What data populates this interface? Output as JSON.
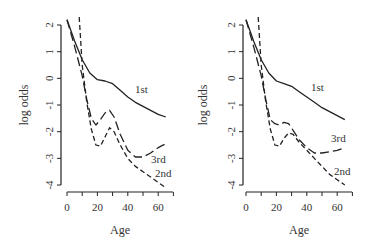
{
  "chart_data": [
    {
      "type": "line",
      "panel": "left",
      "xlabel": "Age",
      "ylabel": "log odds",
      "xlim": [
        0,
        70
      ],
      "ylim": [
        -4,
        2
      ],
      "xticks": [
        0,
        20,
        40,
        60
      ],
      "xticks_minor": [
        0,
        10,
        20,
        30,
        40,
        50,
        60,
        70
      ],
      "yticks": [
        2,
        1,
        0,
        -1,
        -2,
        -3,
        -4
      ],
      "series": [
        {
          "name": "1st",
          "style": "solid",
          "x": [
            0,
            5,
            10,
            15,
            20,
            25,
            30,
            35,
            40,
            45,
            50,
            55,
            60,
            65
          ],
          "y": [
            2.2,
            1.4,
            0.7,
            0.2,
            -0.05,
            -0.1,
            -0.2,
            -0.45,
            -0.7,
            -0.9,
            -1.05,
            -1.2,
            -1.35,
            -1.45
          ]
        },
        {
          "name": "2nd",
          "style": "short-dash",
          "x": [
            8,
            10,
            13,
            16,
            19,
            22,
            25,
            28,
            31,
            35,
            40,
            45,
            50,
            55,
            60,
            65
          ],
          "y": [
            2.3,
            0.5,
            -0.9,
            -1.9,
            -2.5,
            -2.55,
            -2.2,
            -1.85,
            -2.0,
            -2.5,
            -3.0,
            -3.3,
            -3.5,
            -3.7,
            -3.9,
            -4.1
          ]
        },
        {
          "name": "3rd",
          "style": "long-dash",
          "x": [
            0,
            5,
            10,
            13,
            16,
            19,
            22,
            25,
            28,
            31,
            35,
            40,
            45,
            50,
            55,
            60,
            65
          ],
          "y": [
            2.2,
            1.2,
            0.1,
            -0.8,
            -1.5,
            -1.75,
            -1.55,
            -1.3,
            -1.2,
            -1.45,
            -2.1,
            -2.7,
            -2.95,
            -2.95,
            -2.8,
            -2.6,
            -2.45
          ]
        }
      ],
      "annotations": [
        {
          "text": "1st",
          "x": 48,
          "y": -0.35
        },
        {
          "text": "3rd",
          "x": 60,
          "y": -3.05
        },
        {
          "text": "2nd",
          "x": 62,
          "y": -3.5
        }
      ]
    },
    {
      "type": "line",
      "panel": "right",
      "xlabel": "Age",
      "ylabel": "log odds",
      "xlim": [
        0,
        70
      ],
      "ylim": [
        -4,
        2
      ],
      "xticks": [
        0,
        20,
        40,
        60
      ],
      "xticks_minor": [
        0,
        10,
        20,
        30,
        40,
        50,
        60,
        70
      ],
      "yticks": [
        2,
        1,
        0,
        -1,
        -2,
        -3,
        -4
      ],
      "series": [
        {
          "name": "1st",
          "style": "solid",
          "x": [
            0,
            5,
            10,
            15,
            20,
            25,
            30,
            35,
            40,
            45,
            50,
            55,
            60,
            65
          ],
          "y": [
            2.2,
            1.4,
            0.7,
            0.2,
            -0.1,
            -0.2,
            -0.3,
            -0.5,
            -0.7,
            -0.9,
            -1.1,
            -1.25,
            -1.4,
            -1.55
          ]
        },
        {
          "name": "2nd",
          "style": "short-dash",
          "x": [
            8,
            10,
            13,
            16,
            19,
            22,
            25,
            28,
            31,
            35,
            40,
            45,
            50,
            55,
            60,
            65
          ],
          "y": [
            2.3,
            0.5,
            -0.9,
            -1.9,
            -2.5,
            -2.55,
            -2.25,
            -2.05,
            -2.1,
            -2.4,
            -2.7,
            -3.0,
            -3.3,
            -3.6,
            -3.8,
            -4.0
          ]
        },
        {
          "name": "3rd",
          "style": "long-dash",
          "x": [
            0,
            5,
            10,
            13,
            16,
            19,
            22,
            25,
            28,
            31,
            35,
            40,
            45,
            50,
            55,
            60,
            65
          ],
          "y": [
            2.2,
            1.2,
            0.1,
            -0.8,
            -1.55,
            -1.7,
            -1.75,
            -1.65,
            -1.7,
            -1.95,
            -2.3,
            -2.6,
            -2.8,
            -2.8,
            -2.75,
            -2.7,
            -2.6
          ]
        }
      ],
      "annotations": [
        {
          "text": "1st",
          "x": 46,
          "y": -0.3
        },
        {
          "text": "3rd",
          "x": 58,
          "y": -2.2
        },
        {
          "text": "2nd",
          "x": 60,
          "y": -3.6
        }
      ]
    }
  ],
  "panels": [
    {
      "ylabel": "log odds",
      "xlabel": "Age",
      "xtick_labels": [
        "0",
        "20",
        "40",
        "60"
      ],
      "ytick_labels": [
        "2",
        "1",
        "0",
        "-1",
        "-2",
        "-3",
        "-4"
      ],
      "labels": {
        "first": "1st",
        "second": "2nd",
        "third": "3rd"
      }
    },
    {
      "ylabel": "log odds",
      "xlabel": "Age",
      "xtick_labels": [
        "0",
        "20",
        "40",
        "60"
      ],
      "ytick_labels": [
        "2",
        "1",
        "0",
        "-1",
        "-2",
        "-3",
        "-4"
      ],
      "labels": {
        "first": "1st",
        "second": "2nd",
        "third": "3rd"
      }
    }
  ]
}
